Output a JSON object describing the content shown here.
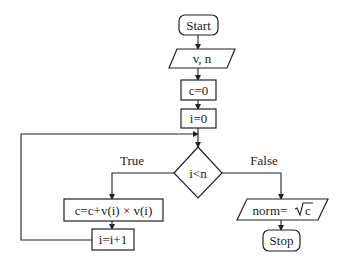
{
  "diagram": {
    "type": "flowchart",
    "nodes": {
      "start": {
        "label": "Start",
        "shape": "rounded-rect"
      },
      "input": {
        "label": "v, n",
        "shape": "parallelogram"
      },
      "init_c": {
        "label": "c=0",
        "shape": "rect"
      },
      "init_i": {
        "label": "i=0",
        "shape": "rect"
      },
      "condition": {
        "label": "i<n",
        "shape": "diamond"
      },
      "accumulate": {
        "label": "c=c+v(i) × v(i)",
        "shape": "rect"
      },
      "increment": {
        "label": "i=i+1",
        "shape": "rect"
      },
      "output": {
        "label_prefix": "norm=",
        "label_radicand": "c",
        "label": "norm=√c",
        "shape": "parallelogram"
      },
      "stop": {
        "label": "Stop",
        "shape": "rounded-rect"
      }
    },
    "edge_labels": {
      "true": "True",
      "false": "False"
    },
    "edges": [
      {
        "from": "start",
        "to": "input"
      },
      {
        "from": "input",
        "to": "init_c"
      },
      {
        "from": "init_c",
        "to": "init_i"
      },
      {
        "from": "init_i",
        "to": "condition"
      },
      {
        "from": "condition",
        "to": "accumulate",
        "label": "True"
      },
      {
        "from": "accumulate",
        "to": "increment"
      },
      {
        "from": "increment",
        "to": "condition",
        "kind": "loop-back"
      },
      {
        "from": "condition",
        "to": "output",
        "label": "False"
      },
      {
        "from": "output",
        "to": "stop"
      }
    ],
    "colors": {
      "stroke": "#222222",
      "fill": "#ffffff"
    }
  }
}
